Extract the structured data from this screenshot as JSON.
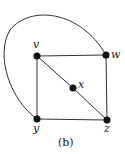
{
  "diagram": {
    "type": "graph",
    "caption": "(b)",
    "colors": {
      "edge": "#333333",
      "vertex": "#111111",
      "background": "#ffffff"
    },
    "vertices": [
      {
        "id": "v",
        "label": "v",
        "x": 37,
        "y": 56
      },
      {
        "id": "w",
        "label": "w",
        "x": 106,
        "y": 55
      },
      {
        "id": "x",
        "label": "x",
        "x": 73,
        "y": 88
      },
      {
        "id": "y",
        "label": "y",
        "x": 37,
        "y": 119
      },
      {
        "id": "z",
        "label": "z",
        "x": 107,
        "y": 120
      }
    ],
    "edges": [
      {
        "from": "v",
        "to": "w",
        "shape": "straight"
      },
      {
        "from": "v",
        "to": "y",
        "shape": "straight"
      },
      {
        "from": "w",
        "to": "z",
        "shape": "straight"
      },
      {
        "from": "y",
        "to": "z",
        "shape": "straight"
      },
      {
        "from": "v",
        "to": "x",
        "shape": "straight"
      },
      {
        "from": "x",
        "to": "z",
        "shape": "straight"
      },
      {
        "from": "w",
        "to": "y",
        "shape": "curved",
        "note": "arc passing around the outside top-left"
      }
    ]
  }
}
